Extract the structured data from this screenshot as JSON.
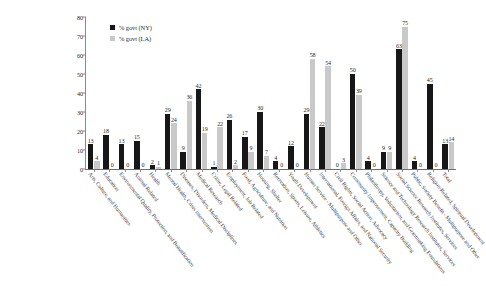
{
  "chart_data": {
    "type": "bar",
    "title": "",
    "xlabel": "",
    "ylabel": "",
    "ylim": [
      0,
      80
    ],
    "ytick_values": [
      0,
      10,
      20,
      30,
      40,
      50,
      60,
      70,
      80
    ],
    "grid": false,
    "legend_position": "top-left",
    "colors": {
      "ny": "#171717",
      "la": "#c9c9c9"
    },
    "categories": [
      "Arts, Culture, and Humanities",
      "Education",
      "Environmental Quality, Protection, and Beautification",
      "Animal-Related",
      "Health",
      "Mental Health, Crisis Intervention",
      "Diseases, Disorders, Medical Disciplines",
      "Medical Research",
      "Crime, Legal Related",
      "Employment, Job Related",
      "Food, Agriculture, and Nutrition",
      "Housing, Shelter",
      "Recreation, Sports, Leisure, Athletics",
      "Youth Development",
      "Human Service - Multipurpose and Other",
      "International, Foreign Affairs, and National Security",
      "Civil Rights, Social Action, Advocacy",
      "Community Improvement, Capacity Building",
      "Philanthropy, Voluntarism, and Grantmaking Foundations",
      "Science and Technology Research Institutes, Services",
      "Social Science Research Institutes, Services",
      "Public, Society Benefit - Multipurpose and Other",
      "Religion-Related, Spiritual Development",
      "Total"
    ],
    "series": [
      {
        "name": "% govt (NY)",
        "color": "#171717",
        "values": [
          13,
          18,
          13,
          15,
          2,
          29,
          9,
          42,
          1,
          26,
          17,
          30,
          4,
          12,
          29,
          22,
          0,
          50,
          4,
          9,
          63,
          4,
          45,
          13
        ]
      },
      {
        "name": "% govt (LA)",
        "color": "#c9c9c9",
        "values": [
          4,
          0,
          0,
          0,
          1,
          24,
          36,
          19,
          22,
          2,
          9,
          7,
          0,
          0,
          58,
          54,
          3,
          39,
          0,
          9,
          75,
          0,
          0,
          14
        ]
      }
    ]
  },
  "legend": {
    "items": [
      {
        "label": "% govt (NY)",
        "swatch": "ny"
      },
      {
        "label": "% govt (LA)",
        "swatch": "la"
      }
    ]
  }
}
